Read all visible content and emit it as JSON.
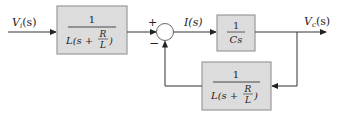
{
  "diagram": {
    "type": "block_diagram",
    "colors": {
      "block_fill": "#dcdcdc",
      "block_border": "#9a9a9a",
      "line": "#333333"
    },
    "input_signal": {
      "label_main": "V",
      "label_sub": "i",
      "label_arg": "(s)"
    },
    "output_signal": {
      "label_main": "V",
      "label_sub": "c",
      "label_arg": "(s)"
    },
    "intermediate_signal": {
      "label": "I(s)"
    },
    "summing_junction": {
      "plus_sign": "+",
      "minus_sign": "−"
    },
    "blocks": [
      {
        "id": "forward-block-1",
        "numerator": "1",
        "denominator_prefix": "L(s +",
        "inner_num": "R",
        "inner_den": "L",
        "denominator_suffix": ")"
      },
      {
        "id": "forward-block-2",
        "numerator": "1",
        "denominator": "Cs"
      },
      {
        "id": "feedback-block",
        "numerator": "1",
        "denominator_prefix": "L(s +",
        "inner_num": "R",
        "inner_den": "L",
        "denominator_suffix": ")"
      }
    ]
  }
}
